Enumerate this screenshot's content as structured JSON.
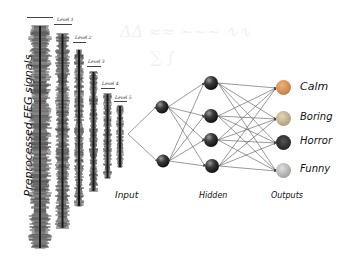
{
  "diagram": {
    "left_label": "Preprocessed EEG signals",
    "levels": [
      {
        "label": "Level 1"
      },
      {
        "label": "Level 2"
      },
      {
        "label": "Level 3"
      },
      {
        "label": "Level 4"
      },
      {
        "label": "Level 5"
      }
    ],
    "layer_labels": {
      "input": "Input",
      "hidden": "Hidden",
      "outputs": "Outputs"
    },
    "network": {
      "input_nodes": 2,
      "hidden_nodes": 4,
      "output_nodes": 4
    },
    "outputs": [
      {
        "label": "Calm",
        "icon": "calm-emoji-icon",
        "color": "#c98a5a"
      },
      {
        "label": "Boring",
        "icon": "boring-emoji-icon",
        "color": "#b9a98a"
      },
      {
        "label": "Horror",
        "icon": "horror-emoji-icon",
        "color": "#2a2a2a"
      },
      {
        "label": "Funny",
        "icon": "funny-emoji-icon",
        "color": "#a9a9a9"
      }
    ],
    "colors": {
      "signal": "#2b2b2b",
      "node": "#333333",
      "edge": "#555555",
      "text": "#111111"
    }
  }
}
